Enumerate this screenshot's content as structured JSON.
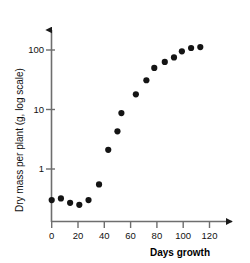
{
  "chart_data": {
    "type": "scatter",
    "title": "",
    "subtitle": "",
    "xlabel": "Days growth",
    "ylabel": "Dry mass per plant (g, log scale)",
    "yscale": "log",
    "xscale": "linear",
    "xlim": [
      -4,
      132
    ],
    "ylim": [
      0.18,
      220
    ],
    "grid": false,
    "legend": null,
    "xticks": [
      0,
      20,
      40,
      60,
      80,
      100,
      120
    ],
    "xtick_labels": [
      "0",
      "20",
      "40",
      "60",
      "80",
      "100",
      "120"
    ],
    "yticks": [
      1,
      10,
      100
    ],
    "ytick_labels": [
      "1",
      "10",
      "100"
    ],
    "marker": "filled-circle",
    "marker_color": "#141414",
    "axis_color": "#6e6e6e",
    "x": [
      0,
      7,
      14,
      21,
      28,
      36,
      43,
      50,
      53,
      64,
      72,
      78,
      86,
      93,
      99,
      106,
      113
    ],
    "y": [
      0.3,
      0.32,
      0.27,
      0.25,
      0.3,
      0.55,
      2.1,
      4.3,
      8.7,
      18,
      31,
      50,
      63,
      75,
      95,
      108,
      112
    ],
    "points": [
      {
        "x": 0,
        "y": 0.3
      },
      {
        "x": 7,
        "y": 0.32
      },
      {
        "x": 14,
        "y": 0.27
      },
      {
        "x": 21,
        "y": 0.25
      },
      {
        "x": 28,
        "y": 0.3
      },
      {
        "x": 36,
        "y": 0.55
      },
      {
        "x": 43,
        "y": 2.1
      },
      {
        "x": 50,
        "y": 4.3
      },
      {
        "x": 53,
        "y": 8.7
      },
      {
        "x": 64,
        "y": 18
      },
      {
        "x": 72,
        "y": 31
      },
      {
        "x": 78,
        "y": 50
      },
      {
        "x": 86,
        "y": 63
      },
      {
        "x": 93,
        "y": 75
      },
      {
        "x": 99,
        "y": 95
      },
      {
        "x": 106,
        "y": 108
      },
      {
        "x": 113,
        "y": 112
      }
    ]
  }
}
